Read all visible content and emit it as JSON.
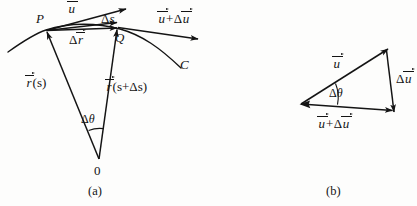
{
  "figure": {
    "background_color": "#fdfdfc",
    "line_color": "#141414",
    "panels": [
      {
        "id": "a",
        "caption": "(a)",
        "origin_label": "0",
        "points": [
          {
            "name": "P",
            "label": "P"
          },
          {
            "name": "Q",
            "label": "Q"
          }
        ],
        "curve_label": "C",
        "labels": {
          "u_vector": "u",
          "delta_s": "s",
          "delta_s_prefix": "Δ",
          "delta_r": "r",
          "delta_r_prefix": "Δ",
          "u_plus_delta_u_first": "u",
          "u_plus_delta_u_op": "+",
          "u_plus_delta_u_prefix": "Δ",
          "u_plus_delta_u_second": "u",
          "r_of_s_symbol": "r",
          "r_of_s_arg": "(s)",
          "r_of_s_plus_symbol": "r",
          "r_of_s_plus_arg": "(s+Δs)",
          "delta_theta_prefix": "Δ",
          "delta_theta_symbol": "θ"
        }
      },
      {
        "id": "b",
        "caption": "(b)",
        "labels": {
          "u_vector": "u",
          "delta_u_prefix": "Δ",
          "delta_u_symbol": "u",
          "u_plus_delta_u_first": "u",
          "u_plus_delta_u_op": "+",
          "u_plus_delta_u_prefix": "Δ",
          "u_plus_delta_u_second": "u",
          "delta_theta_prefix": "Δ",
          "delta_theta_symbol": "θ"
        }
      }
    ]
  }
}
